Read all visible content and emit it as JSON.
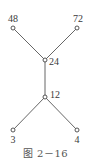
{
  "diagram": {
    "type": "tree",
    "nodes": [
      {
        "id": "n48",
        "label": "48",
        "x": 13,
        "y": 28,
        "label_x": 13,
        "label_y": 22,
        "label_anchor": "middle"
      },
      {
        "id": "n72",
        "label": "72",
        "x": 77,
        "y": 28,
        "label_x": 78,
        "label_y": 22,
        "label_anchor": "middle"
      },
      {
        "id": "n24",
        "label": "24",
        "x": 45,
        "y": 60,
        "label_x": 49,
        "label_y": 65,
        "label_anchor": "start"
      },
      {
        "id": "n12",
        "label": "12",
        "x": 45,
        "y": 97,
        "label_x": 50,
        "label_y": 98,
        "label_anchor": "start"
      },
      {
        "id": "n3",
        "label": "3",
        "x": 13,
        "y": 130,
        "label_x": 13,
        "label_y": 143,
        "label_anchor": "middle"
      },
      {
        "id": "n4",
        "label": "4",
        "x": 77,
        "y": 130,
        "label_x": 77,
        "label_y": 143,
        "label_anchor": "middle"
      }
    ],
    "edges": [
      {
        "from": "n48",
        "to": "n24"
      },
      {
        "from": "n72",
        "to": "n24"
      },
      {
        "from": "n24",
        "to": "n12"
      },
      {
        "from": "n12",
        "to": "n3"
      },
      {
        "from": "n12",
        "to": "n4"
      }
    ],
    "colors": {
      "line": "#555555",
      "node_stroke": "#444444",
      "node_fill": "#ffffff",
      "text": "#3a3a3a"
    }
  },
  "caption": "图 2－16"
}
